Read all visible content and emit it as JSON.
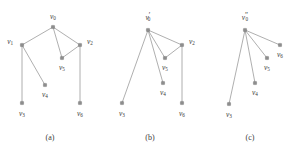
{
  "figure": {
    "width": 297,
    "height": 154,
    "background": "#ffffff",
    "node_color": "#8d8d8d",
    "edge_color": "#9a9a9a",
    "label_color": "#3c3c3c"
  },
  "panels": [
    {
      "id": "panel-a",
      "caption": "(a)",
      "caption_x": 50,
      "caption_y": 138,
      "nodes": [
        {
          "id": "v0",
          "base": "v",
          "sub": "0",
          "prime": "",
          "x": 53,
          "y": 27,
          "label_x": 53,
          "label_y": 17,
          "anchor": "middle"
        },
        {
          "id": "v1",
          "base": "v",
          "sub": "1",
          "prime": "",
          "x": 22,
          "y": 45,
          "label_x": 13,
          "label_y": 42,
          "anchor": "end"
        },
        {
          "id": "v2",
          "base": "v",
          "sub": "2",
          "prime": "",
          "x": 80,
          "y": 45,
          "label_x": 87,
          "label_y": 42,
          "anchor": "start"
        },
        {
          "id": "v5",
          "base": "v",
          "sub": "5",
          "prime": "",
          "x": 62,
          "y": 58,
          "label_x": 62,
          "label_y": 68,
          "anchor": "middle"
        },
        {
          "id": "v4",
          "base": "v",
          "sub": "4",
          "prime": "",
          "x": 45,
          "y": 85,
          "label_x": 45,
          "label_y": 95,
          "anchor": "middle"
        },
        {
          "id": "v3",
          "base": "v",
          "sub": "3",
          "prime": "",
          "x": 22,
          "y": 103,
          "label_x": 22,
          "label_y": 114,
          "anchor": "middle"
        },
        {
          "id": "v6",
          "base": "v",
          "sub": "6",
          "prime": "",
          "x": 80,
          "y": 103,
          "label_x": 80,
          "label_y": 114,
          "anchor": "middle"
        }
      ],
      "edges": [
        {
          "from": "v0",
          "to": "v1"
        },
        {
          "from": "v0",
          "to": "v2"
        },
        {
          "from": "v0",
          "to": "v5"
        },
        {
          "from": "v1",
          "to": "v4"
        },
        {
          "from": "v1",
          "to": "v3"
        },
        {
          "from": "v2",
          "to": "v5"
        },
        {
          "from": "v2",
          "to": "v6"
        }
      ]
    },
    {
      "id": "panel-b",
      "caption": "(b)",
      "caption_x": 150,
      "caption_y": 138,
      "nodes": [
        {
          "id": "v0",
          "base": "v",
          "sub": "0",
          "prime": "′",
          "x": 148,
          "y": 30,
          "label_x": 148,
          "label_y": 18,
          "anchor": "middle"
        },
        {
          "id": "v2",
          "base": "v",
          "sub": "2",
          "prime": "",
          "x": 182,
          "y": 45,
          "label_x": 189,
          "label_y": 42,
          "anchor": "start"
        },
        {
          "id": "v5",
          "base": "v",
          "sub": "5",
          "prime": "",
          "x": 165,
          "y": 58,
          "label_x": 165,
          "label_y": 68,
          "anchor": "middle"
        },
        {
          "id": "v4",
          "base": "v",
          "sub": "4",
          "prime": "",
          "x": 163,
          "y": 83,
          "label_x": 163,
          "label_y": 93,
          "anchor": "middle"
        },
        {
          "id": "v3",
          "base": "v",
          "sub": "3",
          "prime": "",
          "x": 122,
          "y": 103,
          "label_x": 122,
          "label_y": 114,
          "anchor": "middle"
        },
        {
          "id": "v6",
          "base": "v",
          "sub": "6",
          "prime": "",
          "x": 182,
          "y": 103,
          "label_x": 182,
          "label_y": 114,
          "anchor": "middle"
        }
      ],
      "edges": [
        {
          "from": "v0",
          "to": "v3"
        },
        {
          "from": "v0",
          "to": "v4"
        },
        {
          "from": "v0",
          "to": "v5"
        },
        {
          "from": "v0",
          "to": "v2"
        },
        {
          "from": "v2",
          "to": "v5"
        },
        {
          "from": "v2",
          "to": "v6"
        }
      ]
    },
    {
      "id": "panel-c",
      "caption": "(c)",
      "caption_x": 250,
      "caption_y": 138,
      "nodes": [
        {
          "id": "v0",
          "base": "v",
          "sub": "0",
          "prime": "″",
          "x": 245,
          "y": 30,
          "label_x": 245,
          "label_y": 18,
          "anchor": "middle"
        },
        {
          "id": "v6",
          "base": "v",
          "sub": "6",
          "prime": "",
          "x": 280,
          "y": 45,
          "label_x": 280,
          "label_y": 55,
          "anchor": "middle"
        },
        {
          "id": "v5",
          "base": "v",
          "sub": "5",
          "prime": "",
          "x": 267,
          "y": 58,
          "label_x": 267,
          "label_y": 68,
          "anchor": "middle"
        },
        {
          "id": "v4",
          "base": "v",
          "sub": "4",
          "prime": "",
          "x": 255,
          "y": 83,
          "label_x": 255,
          "label_y": 93,
          "anchor": "middle"
        },
        {
          "id": "v3",
          "base": "v",
          "sub": "3",
          "prime": "",
          "x": 229,
          "y": 104,
          "label_x": 229,
          "label_y": 115,
          "anchor": "middle"
        }
      ],
      "edges": [
        {
          "from": "v0",
          "to": "v6"
        },
        {
          "from": "v0",
          "to": "v5"
        },
        {
          "from": "v0",
          "to": "v4"
        },
        {
          "from": "v0",
          "to": "v3"
        }
      ]
    }
  ]
}
